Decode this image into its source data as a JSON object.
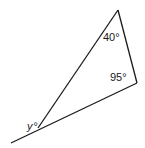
{
  "diagram": {
    "type": "triangle with exterior angle",
    "angles": {
      "top": "40°",
      "right": "95°",
      "exterior": "°",
      "exterior_var": "y"
    },
    "colors": {
      "line": "#1a1a1a",
      "background": "#ffffff"
    }
  }
}
